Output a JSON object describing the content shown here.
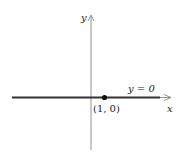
{
  "diagram": {
    "axes": {
      "x_label": "x",
      "y_label": "y"
    },
    "line": {
      "equation": "y = 0",
      "color": "#333333"
    },
    "point": {
      "label": "(1, 0)",
      "x": 1,
      "y": 0
    }
  }
}
